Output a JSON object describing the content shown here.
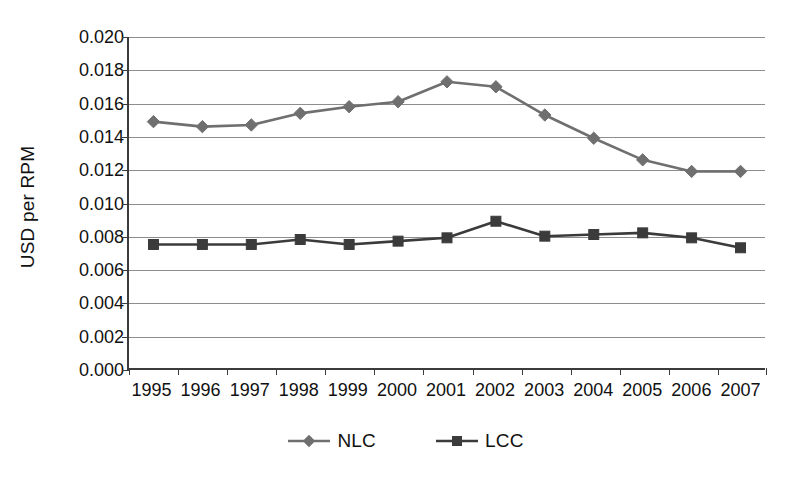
{
  "chart_data": {
    "type": "line",
    "title": "",
    "xlabel": "",
    "ylabel": "USD per RPM",
    "categories": [
      "1995",
      "1996",
      "1997",
      "1998",
      "1999",
      "2000",
      "2001",
      "2002",
      "2003",
      "2004",
      "2005",
      "2006",
      "2007"
    ],
    "ylim": [
      0.0,
      0.02
    ],
    "ytick_labels": [
      "0.020",
      "0.018",
      "0.016",
      "0.014",
      "0.012",
      "0.010",
      "0.008",
      "0.006",
      "0.004",
      "0.002",
      "0.000"
    ],
    "ytick_values": [
      0.02,
      0.018,
      0.016,
      0.014,
      0.012,
      0.01,
      0.008,
      0.006,
      0.004,
      0.002,
      0.0
    ],
    "ytick_step": 0.002,
    "grid": true,
    "legend_position": "bottom",
    "series": [
      {
        "name": "NLC",
        "marker": "diamond",
        "color": "#6f6f6f",
        "values": [
          0.0149,
          0.0146,
          0.0147,
          0.0154,
          0.0158,
          0.0161,
          0.0173,
          0.017,
          0.0153,
          0.0139,
          0.0126,
          0.0119,
          0.0119
        ]
      },
      {
        "name": "LCC",
        "marker": "square",
        "color": "#3b3b3b",
        "values": [
          0.0075,
          0.0075,
          0.0075,
          0.0078,
          0.0075,
          0.0077,
          0.0079,
          0.0089,
          0.008,
          0.0081,
          0.0082,
          0.0079,
          0.0073
        ]
      }
    ]
  },
  "colors": {
    "nlc": "#6f6f6f",
    "lcc": "#3b3b3b",
    "grid": "#8d8d8d",
    "axis": "#3b3b3b",
    "text": "#111111",
    "background": "#ffffff"
  }
}
